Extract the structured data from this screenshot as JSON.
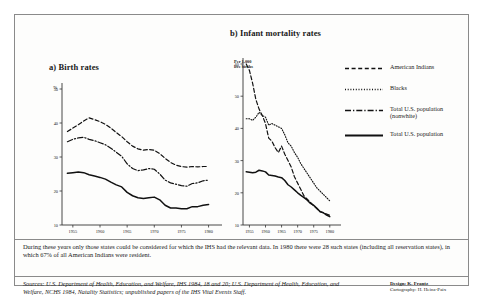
{
  "figure": {
    "panel_a": {
      "title": "a) Birth rates",
      "axis_caption": "%"
    },
    "panel_b": {
      "title": "b) Infant mortality rates",
      "axis_caption": "Per 1,000\nlive births"
    },
    "legend": [
      {
        "label": "American Indians",
        "style": "dashed"
      },
      {
        "label": "Blacks",
        "style": "dotted"
      },
      {
        "label": "Total U.S. population\n(nonwhite)",
        "style": "dash-dot"
      },
      {
        "label": "Total U.S. population",
        "style": "solid"
      }
    ],
    "note": "During these years only those states could be considered for which the IHS had the relevant data. In 1980 there were 28 such states (including all reservation states), in which 67% of all American Indians were resident.",
    "sources": "Sources: U.S. Department of Health, Education, and Welfare, IHS 1984, 18 and 20; U.S. Department of Health, Education, and Welfare, NCHS 1984, Natality Statistics; unpublished papers of the IHS Vital Events Staff.",
    "credit_line1": "Design: K. Frantz",
    "credit_line2": "Cartography: H. Heinz-Paix"
  },
  "chart_data": [
    {
      "type": "line",
      "title": "a) Birth rates",
      "xlabel": "",
      "ylabel": "%",
      "xlim": [
        1953,
        1981
      ],
      "ylim": [
        10,
        50
      ],
      "yticks": [
        10,
        20,
        30,
        40,
        50
      ],
      "xticks": [
        1955,
        1960,
        1965,
        1970,
        1975,
        1980
      ],
      "grid": false,
      "series": [
        {
          "name": "American Indians",
          "style": "dashed",
          "x": [
            1954,
            1955,
            1956,
            1957,
            1958,
            1959,
            1960,
            1961,
            1962,
            1963,
            1964,
            1965,
            1966,
            1967,
            1968,
            1969,
            1970,
            1971,
            1972,
            1973,
            1974,
            1975,
            1976,
            1977,
            1978,
            1979,
            1980
          ],
          "values": [
            37.5,
            38.5,
            39.5,
            40.6,
            41.5,
            41.0,
            40.4,
            39.6,
            38.5,
            37.2,
            36.0,
            34.5,
            33.2,
            32.4,
            32.0,
            32.2,
            32.0,
            31.0,
            29.6,
            28.4,
            27.6,
            27.2,
            27.0,
            27.2,
            27.1,
            27.2,
            27.2
          ]
        },
        {
          "name": "Total U.S. population (nonwhite)",
          "style": "dash-dot",
          "x": [
            1954,
            1955,
            1956,
            1957,
            1958,
            1959,
            1960,
            1961,
            1962,
            1963,
            1964,
            1965,
            1966,
            1967,
            1968,
            1969,
            1970,
            1971,
            1972,
            1973,
            1974,
            1975,
            1976,
            1977,
            1978,
            1979,
            1980
          ],
          "values": [
            34.5,
            35.2,
            35.6,
            35.8,
            35.2,
            34.8,
            34.2,
            33.6,
            32.6,
            31.4,
            30.2,
            28.0,
            26.6,
            26.0,
            26.2,
            26.6,
            26.4,
            25.0,
            23.2,
            22.4,
            22.0,
            21.6,
            21.4,
            22.2,
            22.4,
            23.0,
            23.2
          ]
        },
        {
          "name": "Total U.S. population",
          "style": "solid",
          "x": [
            1954,
            1955,
            1956,
            1957,
            1958,
            1959,
            1960,
            1961,
            1962,
            1963,
            1964,
            1965,
            1966,
            1967,
            1968,
            1969,
            1970,
            1971,
            1972,
            1973,
            1974,
            1975,
            1976,
            1977,
            1978,
            1979,
            1980
          ],
          "values": [
            25.2,
            25.4,
            25.6,
            25.4,
            24.8,
            24.4,
            24.0,
            23.5,
            22.6,
            21.8,
            21.2,
            19.6,
            18.6,
            18.0,
            17.8,
            18.0,
            18.2,
            17.4,
            15.8,
            15.0,
            15.0,
            14.8,
            14.8,
            15.4,
            15.4,
            15.8,
            16.0
          ]
        }
      ]
    },
    {
      "type": "line",
      "title": "b) Infant mortality rates",
      "xlabel": "",
      "ylabel": "Per 1,000 live births",
      "xlim": [
        1953,
        1981
      ],
      "ylim": [
        10,
        60
      ],
      "yticks": [
        10,
        20,
        30,
        40,
        50,
        60
      ],
      "xticks": [
        1955,
        1960,
        1965,
        1970,
        1975,
        1980
      ],
      "grid": false,
      "series": [
        {
          "name": "American Indians",
          "style": "dashed",
          "x": [
            1954,
            1955,
            1956,
            1957,
            1958,
            1959,
            1960,
            1961,
            1962,
            1963,
            1964,
            1965,
            1966,
            1967,
            1968,
            1969,
            1970,
            1971,
            1972,
            1973,
            1974,
            1975,
            1976,
            1977,
            1978,
            1979,
            1980
          ],
          "values": [
            60.0,
            58.0,
            54.0,
            49.0,
            46.0,
            44.0,
            41.5,
            37.0,
            36.0,
            34.0,
            32.5,
            34.5,
            32.0,
            30.0,
            28.0,
            25.0,
            23.0,
            21.0,
            19.0,
            18.0,
            17.0,
            16.0,
            15.0,
            14.2,
            13.8,
            13.4,
            13.0
          ]
        },
        {
          "name": "Blacks",
          "style": "dotted",
          "x": [
            1954,
            1955,
            1956,
            1957,
            1958,
            1959,
            1960,
            1961,
            1962,
            1963,
            1964,
            1965,
            1966,
            1967,
            1968,
            1969,
            1970,
            1971,
            1972,
            1973,
            1974,
            1975,
            1976,
            1977,
            1978,
            1979,
            1980
          ],
          "values": [
            43.0,
            43.0,
            42.5,
            43.5,
            45.0,
            44.0,
            43.5,
            41.0,
            41.5,
            41.0,
            40.5,
            40.0,
            38.0,
            35.5,
            34.5,
            32.5,
            31.0,
            29.0,
            27.5,
            26.0,
            24.5,
            23.0,
            21.5,
            20.5,
            19.5,
            18.5,
            17.5
          ]
        },
        {
          "name": "Total U.S. population",
          "style": "solid",
          "x": [
            1954,
            1955,
            1956,
            1957,
            1958,
            1959,
            1960,
            1961,
            1962,
            1963,
            1964,
            1965,
            1966,
            1967,
            1968,
            1969,
            1970,
            1971,
            1972,
            1973,
            1974,
            1975,
            1976,
            1977,
            1978,
            1979,
            1980
          ],
          "values": [
            26.5,
            26.4,
            26.2,
            26.4,
            27.0,
            26.8,
            26.5,
            25.5,
            25.4,
            25.2,
            24.9,
            24.7,
            23.8,
            22.5,
            21.8,
            20.9,
            20.0,
            19.2,
            18.5,
            17.7,
            16.7,
            16.1,
            15.2,
            14.1,
            13.8,
            13.1,
            12.6
          ]
        }
      ]
    }
  ]
}
